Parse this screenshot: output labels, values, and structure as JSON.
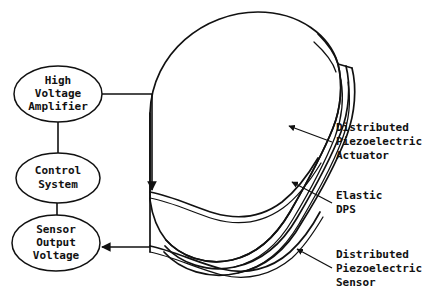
{
  "diagram": {
    "background_color": "#ffffff",
    "line_color": "#111111",
    "nodes": [
      {
        "id": "high-voltage-amplifier",
        "lines": [
          "High",
          "Voltage",
          "Amplifier"
        ],
        "shape": "ellipse",
        "cx": 58,
        "cy": 94,
        "rx": 44,
        "ry": 28
      },
      {
        "id": "control-system",
        "lines": [
          "Control",
          "System"
        ],
        "shape": "ellipse",
        "cx": 58,
        "cy": 178,
        "rx": 42,
        "ry": 25
      },
      {
        "id": "sensor-output-voltage",
        "lines": [
          "Sensor",
          "Output",
          "Voltage"
        ],
        "shape": "ellipse",
        "cx": 56,
        "cy": 243,
        "rx": 44,
        "ry": 28
      }
    ],
    "callouts": [
      {
        "id": "distributed-piezoelectric-actuator",
        "lines": [
          "Distributed",
          "Piezoelectric",
          "Actuator"
        ],
        "text_x": 336,
        "text_y": 128,
        "leader_from_x": 330,
        "leader_from_y": 142,
        "leader_to_x": 288,
        "leader_to_y": 126
      },
      {
        "id": "elastic-dps",
        "lines": [
          "Elastic",
          "DPS"
        ],
        "text_x": 336,
        "text_y": 196,
        "leader_from_x": 330,
        "leader_from_y": 202,
        "leader_to_x": 291,
        "leader_to_y": 181
      },
      {
        "id": "distributed-piezoelectric-sensor",
        "lines": [
          "Distributed",
          "Piezoelectric",
          "Sensor"
        ],
        "text_x": 336,
        "text_y": 255,
        "leader_from_x": 330,
        "leader_from_y": 268,
        "leader_to_x": 296,
        "leader_to_y": 248
      }
    ],
    "connections": [
      {
        "id": "amplifier-to-shell",
        "from": "high-voltage-amplifier",
        "to": "shell-actuator-surface",
        "arrow": "down"
      },
      {
        "id": "control-to-amplifier",
        "from": "control-system",
        "to": "high-voltage-amplifier",
        "arrow": "none"
      },
      {
        "id": "control-to-sensor-output",
        "from": "control-system",
        "to": "sensor-output-voltage",
        "arrow": "none"
      },
      {
        "id": "shell-to-sensor-output",
        "from": "shell-sensor-surface",
        "to": "sensor-output-voltage",
        "arrow": "left"
      }
    ],
    "shell": {
      "id": "distributed-parameter-shell",
      "description": "curved cylindrical shell panel with three laminated layers"
    }
  }
}
